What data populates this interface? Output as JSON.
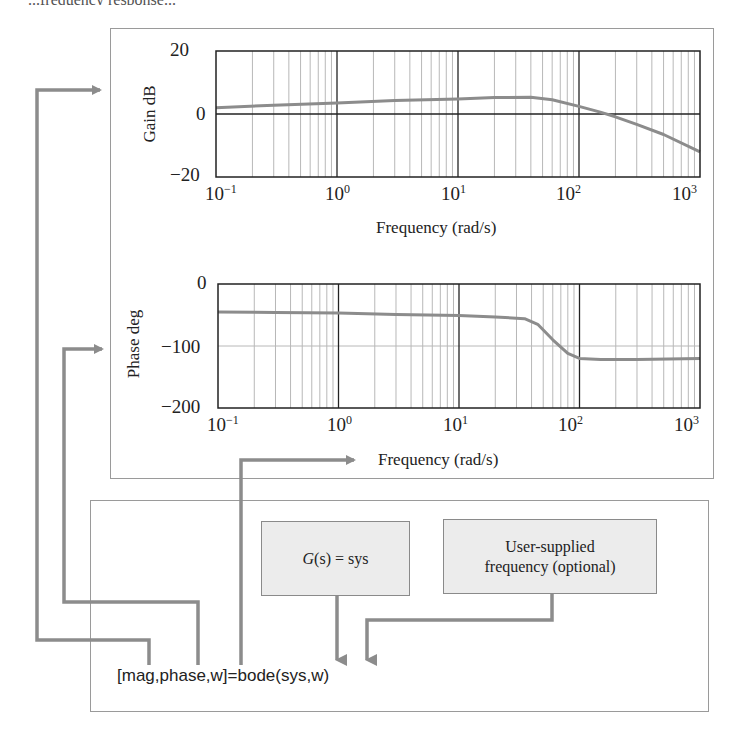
{
  "caption_fragment": "...frequency response...",
  "colors": {
    "curve": "#8c8c8c",
    "arrow": "#8c8c8c",
    "grid_major": "#222222",
    "grid_minor": "#b8b8b8",
    "box_fill": "#ececec",
    "panel_border": "#9a9a9a"
  },
  "gain_plot": {
    "ylabel": "Gain dB",
    "xlabel": "Frequency (rad/s)",
    "yticks": [
      "20",
      "0",
      "−20"
    ],
    "xticks": [
      {
        "base": "10",
        "exp": "−1"
      },
      {
        "base": "10",
        "exp": "0"
      },
      {
        "base": "10",
        "exp": "1"
      },
      {
        "base": "10",
        "exp": "2"
      },
      {
        "base": "10",
        "exp": "3"
      }
    ]
  },
  "phase_plot": {
    "ylabel": "Phase deg",
    "xlabel": "Frequency (rad/s)",
    "yticks": [
      "0",
      "−100",
      "−200"
    ],
    "xticks": [
      {
        "base": "10",
        "exp": "−1"
      },
      {
        "base": "10",
        "exp": "0"
      },
      {
        "base": "10",
        "exp": "1"
      },
      {
        "base": "10",
        "exp": "2"
      },
      {
        "base": "10",
        "exp": "3"
      }
    ]
  },
  "bottom_panel": {
    "system_box": {
      "label_italic": "G",
      "label_paren": "(s)",
      "label_rest": " = sys"
    },
    "frequency_box": {
      "line1": "User-supplied",
      "line2": "frequency (optional)"
    },
    "command": "[mag,phase,w]=bode(sys,w)"
  },
  "chart_data": [
    {
      "type": "line",
      "title": "",
      "xlabel": "Frequency (rad/s)",
      "ylabel": "Gain dB",
      "xscale": "log",
      "xlim": [
        0.1,
        1000
      ],
      "ylim": [
        -20,
        20
      ],
      "grid": true,
      "xtick_labels": [
        "10^-1",
        "10^0",
        "10^1",
        "10^2",
        "10^3"
      ],
      "ytick_labels": [
        "-20",
        "0",
        "20"
      ],
      "series": [
        {
          "name": "Gain",
          "x": [
            0.1,
            0.3,
            1,
            3,
            10,
            20,
            40,
            60,
            100,
            150,
            200,
            300,
            500,
            1000
          ],
          "y": [
            2,
            2.8,
            3.5,
            4.3,
            4.8,
            5.2,
            5.3,
            4.5,
            2.4,
            0.6,
            -0.9,
            -3.3,
            -6.5,
            -12
          ]
        }
      ]
    },
    {
      "type": "line",
      "title": "",
      "xlabel": "Frequency (rad/s)",
      "ylabel": "Phase deg",
      "xscale": "log",
      "xlim": [
        0.1,
        1000
      ],
      "ylim": [
        -200,
        0
      ],
      "grid": true,
      "xtick_labels": [
        "10^-1",
        "10^0",
        "10^1",
        "10^2",
        "10^3"
      ],
      "ytick_labels": [
        "-200",
        "-100",
        "0"
      ],
      "series": [
        {
          "name": "Phase",
          "x": [
            0.1,
            0.3,
            1,
            3,
            10,
            20,
            35,
            45,
            60,
            80,
            100,
            150,
            300,
            1000
          ],
          "y": [
            -45,
            -46,
            -47,
            -49,
            -51,
            -53,
            -56,
            -65,
            -90,
            -112,
            -120,
            -122,
            -122,
            -120
          ]
        }
      ]
    }
  ]
}
